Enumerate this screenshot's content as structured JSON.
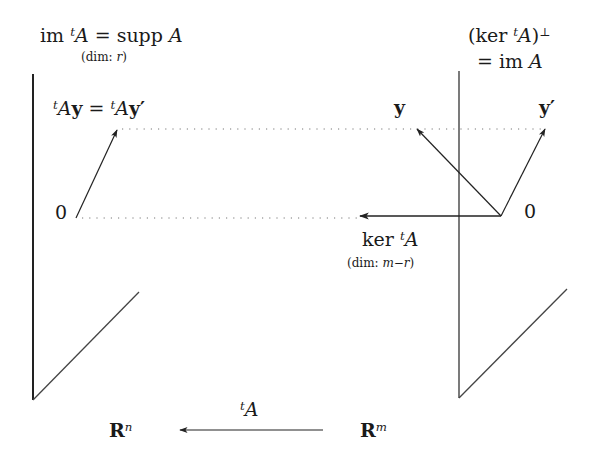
{
  "labels": {
    "left_space_title": "im ᵗA = supp A",
    "left_space_title_parts": {
      "im": "im",
      "t": "t",
      "A": "A",
      "eq": "=",
      "supp": "supp",
      "A2": "A"
    },
    "left_dim": "(dim: r)",
    "left_dim_parts": {
      "prefix": "(dim: ",
      "var": "r",
      "suffix": ")"
    },
    "image_equation": "ᵗAy = ᵗAy′",
    "image_equation_parts": {
      "t1": "t",
      "A1": "A",
      "y1": "y",
      "eq": "=",
      "t2": "t",
      "A2": "A",
      "y2": "y′"
    },
    "left_origin": "0",
    "right_space_title_line1": "(ker ᵗA)⊥",
    "right_space_title_line1_parts": {
      "open": "(ker ",
      "t": "t",
      "A": "A",
      "close": ")",
      "perp": "⊥"
    },
    "right_space_title_line2": "= im A",
    "right_space_title_line2_parts": {
      "eq": "= im ",
      "A": "A"
    },
    "vector_y": "y",
    "vector_y_prime": "y′",
    "right_origin": "0",
    "kernel_label": "ker ᵗA",
    "kernel_label_parts": {
      "ker": "ker ",
      "t": "t",
      "A": "A"
    },
    "kernel_dim": "(dim: m−r)",
    "kernel_dim_parts": {
      "prefix": "(dim: ",
      "var": "m−r",
      "suffix": ")"
    },
    "domain_space": "Rⁿ",
    "domain_space_parts": {
      "R": "R",
      "exp": "n"
    },
    "codomain_space": "Rᵐ",
    "codomain_space_parts": {
      "R": "R",
      "exp": "m"
    },
    "map_label": "ᵗA",
    "map_label_parts": {
      "t": "t",
      "A": "A"
    }
  },
  "colors": {
    "ink": "#1a1a1a",
    "line": "#333333",
    "dotted": "#777777",
    "background": "#ffffff"
  }
}
